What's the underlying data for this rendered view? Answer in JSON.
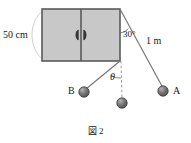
{
  "figure": {
    "caption_symbol": "図",
    "caption_number": "2",
    "labels": {
      "width_label": "50 cm",
      "angle_label": "30°",
      "string_label": "1 m",
      "theta_label": "θ",
      "ball_b_label": "B",
      "ball_a_label": "A"
    },
    "colors": {
      "door_fill": "#c8c8c8",
      "door_stroke": "#5a5a5a",
      "ball_fill": "#6e6e6e",
      "ball_stroke": "#3c3c3c",
      "line_stroke": "#666666",
      "arc_stroke": "#cccccc",
      "text": "#1a1a1a",
      "background": "#ffffff"
    },
    "geometry": {
      "door_left": 42,
      "door_top": 9,
      "door_right": 120,
      "door_bottom": 61,
      "door_center_x": 81,
      "pivot_x": 120,
      "pivot_y": 61,
      "ball_a_x": 163,
      "ball_a_y": 91,
      "ball_b_x": 84,
      "ball_b_y": 92,
      "ball_rest_x": 122,
      "ball_rest_y": 103,
      "ball_radius": 5
    }
  }
}
